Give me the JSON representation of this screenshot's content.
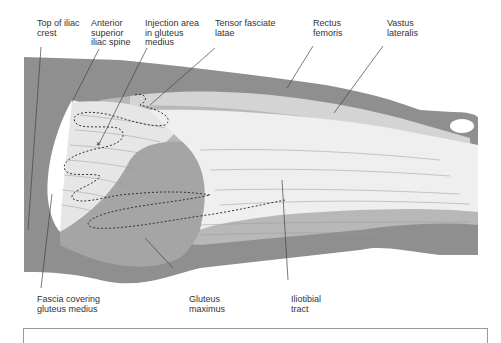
{
  "figure": {
    "labels": {
      "top_of_iliac_crest": "Top of iliac\ncrest",
      "anterior_superior_iliac_spine": "Anterior\nsuperior\niliac spine",
      "injection_area": "Injection area\nin gluteus\nmedius",
      "tensor_fasciae_latae": "Tensor fasciate\nlatae",
      "rectus_femoris": "Rectus\nfemoris",
      "vastus_lateralis": "Vastus\nlateralis",
      "fascia_covering_gluteus_medius": "Fascia covering\ngluteus medius",
      "gluteus_maximus": "Gluteus\nmaximus",
      "iliotibial_tract": "Iliotibial\ntract"
    },
    "colors": {
      "outer_skin": "#8f8f8f",
      "muscle_dark": "#a8a8a8",
      "muscle_mid": "#c4c4c4",
      "muscle_light": "#e2e2e2",
      "tract_light": "#f0f0f0",
      "fascia_white": "#ffffff",
      "leader_line": "#444444",
      "dotted_outline": "#333333"
    }
  }
}
